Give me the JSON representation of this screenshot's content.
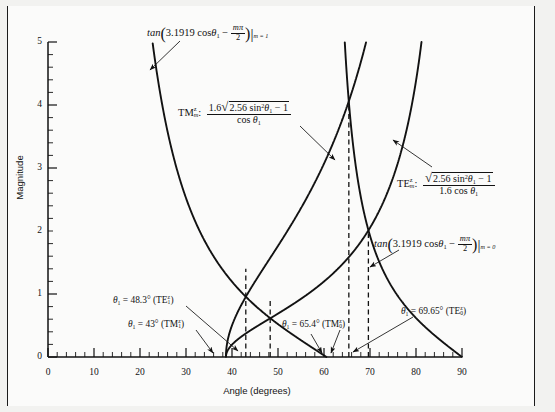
{
  "figure": {
    "background_color": "#f2f2f0",
    "plot_background_color": "#fbfbfa",
    "curve_color": "#121212",
    "border_color": "#1b1b1b"
  },
  "axes": {
    "x_label": "Angle (degrees)",
    "y_label": "Magnitude",
    "x_ticks": [
      "0",
      "10",
      "20",
      "30",
      "40",
      "50",
      "60",
      "70",
      "80",
      "90"
    ],
    "y_ticks": [
      "0",
      "1",
      "2",
      "3",
      "4",
      "5"
    ],
    "x_min": 0,
    "x_max": 90,
    "y_min": 0,
    "y_max": 5,
    "x_major_step": 10,
    "x_minor_step": 2,
    "y_major_step": 1,
    "y_minor_step": 0.2
  },
  "annotations": {
    "tan_m1": {
      "fn": "tan",
      "open": "(",
      "coef": "3.1919 cos",
      "theta": "θ",
      "theta_sub": "1",
      "minus": "−",
      "frac_top": "mπ",
      "frac_bot": "2",
      "close": ")",
      "bar": "|",
      "cond": "m = 1"
    },
    "tan_m0": {
      "fn": "tan",
      "open": "(",
      "coef": "3.1919 cos",
      "theta": "θ",
      "theta_sub": "1",
      "minus": "−",
      "frac_top": "mπ",
      "frac_bot": "2",
      "close": ")",
      "bar": "|",
      "cond": "m = 0"
    },
    "tm_expr": {
      "name": "TM",
      "name_sup": "z",
      "name_sub": "m",
      "colon": ":",
      "lead": "1.6",
      "radical": "√",
      "radicand": "2.56 sin",
      "radicand_sup": "2",
      "theta": "θ",
      "theta_sub": "1",
      "minus_one": "− 1",
      "denom_cos": "cos",
      "denom_theta": "θ",
      "denom_theta_sub": "1"
    },
    "te_expr": {
      "name": "TE",
      "name_sup": "z",
      "name_sub": "m",
      "colon": ":",
      "radical": "√",
      "radicand": "2.56 sin",
      "radicand_sup": "2",
      "theta": "θ",
      "theta_sub": "1",
      "minus_one": "− 1",
      "denom": "1.6 cos",
      "denom_theta": "θ",
      "denom_theta_sub": "1"
    },
    "root_te1": {
      "theta": "θ",
      "theta_sub": "1",
      "eq": "= 48.3° (TE",
      "mode_sup": "z",
      "mode_sub": "1",
      "close": ")"
    },
    "root_tm1": {
      "theta": "θ",
      "theta_sub": "1",
      "eq": "= 43° (TM",
      "mode_sup": "z",
      "mode_sub": "1",
      "close": ")"
    },
    "root_tm0": {
      "theta": "θ",
      "theta_sub": "1",
      "eq": "= 65.4° (TM",
      "mode_sup": "z",
      "mode_sub": "0",
      "close": ")"
    },
    "root_te0": {
      "theta": "θ",
      "theta_sub": "1",
      "eq": "= 69.65° (TE",
      "mode_sup": "z",
      "mode_sub": "0",
      "close": ")"
    }
  },
  "chart_data": {
    "type": "line",
    "title": "",
    "xlabel": "Angle (degrees)",
    "ylabel": "Magnitude",
    "xlim": [
      0,
      90
    ],
    "ylim": [
      0,
      5
    ],
    "grid": false,
    "legend": "none",
    "cutoff_angle_deg": 38.68,
    "series": [
      {
        "name": "tan(3.1919 cos theta1 - m*pi/2) | m=1",
        "formula": "tan(3.1919*cos(theta)-pi/2)",
        "x_start_deg": 23.5,
        "x_end_deg": 61.0,
        "points": [
          [
            23.5,
            5.0
          ],
          [
            26.0,
            4.45
          ],
          [
            28.0,
            4.06
          ],
          [
            30.0,
            3.72
          ],
          [
            32.0,
            3.41
          ],
          [
            34.0,
            3.12
          ],
          [
            36.0,
            2.86
          ],
          [
            38.0,
            2.61
          ],
          [
            40.0,
            2.38
          ],
          [
            42.0,
            2.16
          ],
          [
            44.0,
            1.95
          ],
          [
            46.0,
            1.74
          ],
          [
            48.0,
            1.54
          ],
          [
            50.0,
            1.35
          ],
          [
            52.0,
            1.15
          ],
          [
            54.0,
            0.95
          ],
          [
            56.0,
            0.75
          ],
          [
            58.0,
            0.53
          ],
          [
            60.0,
            0.28
          ],
          [
            61.0,
            0.0
          ]
        ]
      },
      {
        "name": "tan(3.1919 cos theta1 - m*pi/2) | m=0",
        "formula": "tan(3.1919*cos(theta))",
        "x_start_deg": 64.4,
        "x_end_deg": 90.0,
        "points": [
          [
            64.4,
            5.0
          ],
          [
            65.0,
            4.35
          ],
          [
            65.4,
            4.0
          ],
          [
            66.0,
            3.55
          ],
          [
            67.0,
            2.95
          ],
          [
            68.0,
            2.49
          ],
          [
            69.0,
            2.15
          ],
          [
            69.65,
            1.96
          ],
          [
            70.0,
            1.87
          ],
          [
            72.0,
            1.45
          ],
          [
            74.0,
            1.14
          ],
          [
            76.0,
            0.9
          ],
          [
            78.0,
            0.7
          ],
          [
            80.0,
            0.52
          ],
          [
            82.0,
            0.37
          ],
          [
            84.0,
            0.24
          ],
          [
            86.0,
            0.14
          ],
          [
            88.0,
            0.05
          ],
          [
            90.0,
            0.0
          ]
        ]
      },
      {
        "name": "TM_m^z : 1.6*sqrt(2.56 sin^2 theta1 - 1)/cos theta1",
        "formula": "1.6*sqrt(2.56*sin(theta)^2-1)/cos(theta)",
        "x_start_deg": 38.68,
        "x_end_deg": 66.2,
        "points": [
          [
            38.68,
            0.0
          ],
          [
            39.0,
            0.3
          ],
          [
            40.0,
            0.7
          ],
          [
            41.0,
            0.97
          ],
          [
            42.0,
            1.19
          ],
          [
            43.0,
            1.4
          ],
          [
            44.0,
            1.59
          ],
          [
            46.0,
            1.95
          ],
          [
            48.0,
            2.3
          ],
          [
            50.0,
            2.66
          ],
          [
            52.0,
            3.03
          ],
          [
            54.0,
            3.43
          ],
          [
            56.0,
            3.87
          ],
          [
            58.0,
            4.36
          ],
          [
            60.0,
            4.93
          ],
          [
            61.0,
            5.25
          ],
          [
            65.4,
            4.0
          ]
        ]
      },
      {
        "name": "TE_m^z : sqrt(2.56 sin^2 theta1 - 1)/(1.6 cos theta1)",
        "formula": "sqrt(2.56*sin(theta)^2-1)/(1.6*cos(theta))",
        "x_start_deg": 38.68,
        "x_end_deg": 83.5,
        "points": [
          [
            38.68,
            0.0
          ],
          [
            40.0,
            0.27
          ],
          [
            42.0,
            0.46
          ],
          [
            44.0,
            0.62
          ],
          [
            46.0,
            0.76
          ],
          [
            48.3,
            0.91
          ],
          [
            50.0,
            1.04
          ],
          [
            54.0,
            1.34
          ],
          [
            58.0,
            1.7
          ],
          [
            62.0,
            2.16
          ],
          [
            66.0,
            2.8
          ],
          [
            69.65,
            1.96
          ],
          [
            70.0,
            3.8
          ],
          [
            74.0,
            5.0
          ]
        ]
      }
    ],
    "marked_roots": [
      {
        "theta_deg": 43.0,
        "mode": "TM_1^z"
      },
      {
        "theta_deg": 48.3,
        "mode": "TE_1^z"
      },
      {
        "theta_deg": 65.4,
        "mode": "TM_0^z"
      },
      {
        "theta_deg": 69.65,
        "mode": "TE_0^z"
      }
    ]
  }
}
